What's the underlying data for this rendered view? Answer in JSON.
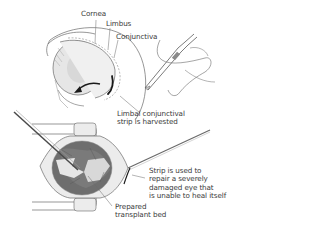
{
  "diagram": {
    "type": "medical-illustration",
    "colors": {
      "line": "#5a5a5a",
      "eye_fill": "#e4e4e4",
      "tissue_dark": "#6e6e6e",
      "tissue_light": "#d0d0d0",
      "speculum_fill": "#ececec",
      "arrow": "#1a1a1a",
      "text": "#3a3a3a"
    }
  },
  "labels": {
    "cornea": "Cornea",
    "limbus": "Limbus",
    "conjunctiva": "Conjunctiva",
    "harvest": [
      "Limbal conjunctival",
      "strip is harvested"
    ],
    "repair": [
      "Strip is used to",
      "repair a severely",
      "damaged eye that",
      "is unable to heal itself"
    ],
    "bed": [
      "Prepared",
      "transplant bed"
    ]
  },
  "icons": {
    "scalpel": "scalpel-in-hand",
    "forceps": "forceps",
    "speculum": "eyelid-speculum",
    "arrow": "curved-arrow"
  }
}
